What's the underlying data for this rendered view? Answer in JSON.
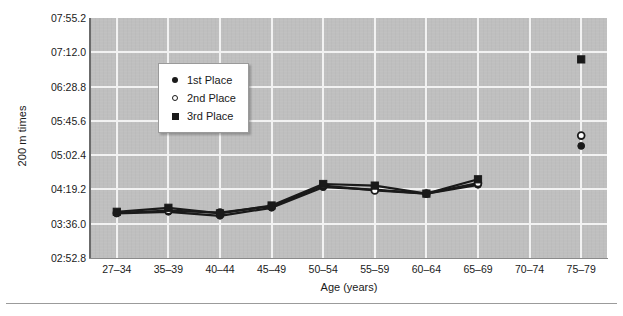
{
  "chart_data": {
    "type": "line",
    "title": "",
    "xlabel": "Age (years)",
    "ylabel": "200 m times",
    "categories": [
      "27–34",
      "35–39",
      "40–44",
      "45–49",
      "50–54",
      "55–59",
      "60–64",
      "65–69",
      "70–74",
      "75–79"
    ],
    "ytick_labels": [
      "07:55.2",
      "07:12.0",
      "06:28.8",
      "05:45.6",
      "05:02.4",
      "04:19.2",
      "03:36.0",
      "02:52.8"
    ],
    "ytick_seconds": [
      475.2,
      432.0,
      388.8,
      345.6,
      302.4,
      259.2,
      216.0,
      172.8
    ],
    "ylim_seconds": [
      172.8,
      475.2
    ],
    "grid": true,
    "legend_position": "upper-left-inside",
    "series": [
      {
        "name": "1st Place",
        "marker": "filled-circle",
        "values_seconds": [
          229.0,
          231.0,
          226.0,
          236.0,
          262.0,
          259.0,
          254.0,
          265.0,
          null,
          314.0
        ],
        "values_labels": [
          "03:49",
          "03:51",
          "03:46",
          "03:56",
          "04:22",
          "04:19",
          "04:14",
          "04:25",
          "",
          "05:14"
        ]
      },
      {
        "name": "2nd Place",
        "marker": "open-circle",
        "values_seconds": [
          229.5,
          232.5,
          230.0,
          238.0,
          264.0,
          258.0,
          254.0,
          267.0,
          null,
          327.0
        ],
        "values_labels": [
          "03:50",
          "03:52",
          "03:50",
          "03:58",
          "04:24",
          "04:18",
          "04:14",
          "04:27",
          "",
          "05:27"
        ]
      },
      {
        "name": "3rd Place",
        "marker": "filled-square",
        "values_seconds": [
          231.0,
          236.0,
          229.0,
          239.0,
          266.0,
          264.0,
          254.0,
          272.0,
          null,
          423.0
        ],
        "values_labels": [
          "03:51",
          "03:56",
          "03:49",
          "03:59",
          "04:26",
          "04:24",
          "04:14",
          "04:32",
          "",
          "07:03"
        ]
      }
    ]
  },
  "legend": {
    "items": [
      {
        "label": "1st Place",
        "marker": "filled-circle"
      },
      {
        "label": "2nd Place",
        "marker": "open-circle"
      },
      {
        "label": "3rd Place",
        "marker": "filled-square"
      }
    ]
  },
  "colors": {
    "plot_background": "#bfbfbf",
    "gridline": "#f2f2f2",
    "series_ink": "#1a1a1a",
    "axis_spine": "#6b6b6b",
    "page_background": "#ffffff"
  }
}
